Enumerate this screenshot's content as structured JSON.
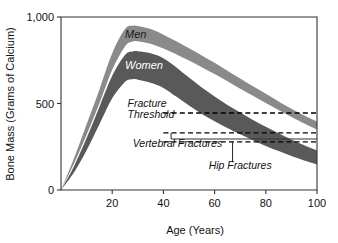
{
  "chart_data": {
    "type": "area",
    "title": "",
    "xlabel": "Age (Years)",
    "ylabel": "Bone Mass (Grams of Calcium)",
    "xlim": [
      0,
      100
    ],
    "ylim": [
      0,
      1000
    ],
    "grid": false,
    "legend_position": "inline-on-bands",
    "x_ticks": [
      20,
      40,
      60,
      80,
      100
    ],
    "x_tick_labels": [
      "20",
      "40",
      "60",
      "80",
      "100"
    ],
    "y_ticks": [
      0,
      500,
      1000
    ],
    "y_tick_labels": [
      "0",
      "500",
      "1,000"
    ],
    "series": [
      {
        "name": "Men",
        "label": "Men",
        "color": "#8a8a8a",
        "label_color": "#1a1a1a",
        "x": [
          0,
          5,
          10,
          15,
          20,
          25,
          28,
          30,
          35,
          40,
          45,
          50,
          55,
          60,
          65,
          70,
          75,
          80,
          85,
          90,
          95,
          100
        ],
        "upper": [
          0,
          180,
          380,
          580,
          790,
          930,
          950,
          948,
          930,
          898,
          860,
          820,
          778,
          735,
          690,
          645,
          600,
          556,
          512,
          470,
          430,
          395
        ],
        "lower": [
          0,
          150,
          320,
          500,
          695,
          830,
          858,
          860,
          845,
          818,
          785,
          748,
          710,
          670,
          628,
          585,
          545,
          503,
          462,
          422,
          385,
          350
        ]
      },
      {
        "name": "Women",
        "label": "Women",
        "color": "#595959",
        "label_color": "#ffffff",
        "x": [
          0,
          5,
          10,
          15,
          20,
          25,
          28,
          30,
          35,
          40,
          45,
          50,
          55,
          60,
          65,
          70,
          75,
          80,
          85,
          90,
          95,
          100
        ],
        "upper": [
          0,
          135,
          300,
          480,
          660,
          780,
          800,
          802,
          790,
          762,
          710,
          650,
          592,
          540,
          492,
          448,
          405,
          365,
          328,
          292,
          258,
          228
        ],
        "lower": [
          0,
          100,
          230,
          380,
          530,
          625,
          640,
          638,
          620,
          590,
          540,
          488,
          440,
          398,
          358,
          322,
          288,
          255,
          225,
          196,
          170,
          148
        ]
      }
    ],
    "threshold_lines": [
      {
        "name": "fracture-threshold",
        "value": 445,
        "x_start": 40,
        "x_end": 100,
        "style": "dashed"
      },
      {
        "name": "vertebral-fractures-threshold",
        "value": 330,
        "x_start": 40,
        "x_end": 100,
        "style": "dashed"
      },
      {
        "name": "hip-fractures-threshold",
        "value": 278,
        "x_start": 40,
        "x_end": 100,
        "style": "dashed"
      }
    ],
    "annotations": [
      {
        "name": "fracture-threshold",
        "lines": [
          "Fracture",
          "Threshold"
        ],
        "x": 26,
        "y": 480
      },
      {
        "name": "vertebral-fractures",
        "lines": [
          "Vertebral Fractures"
        ],
        "x": 28,
        "y": 250,
        "leader": {
          "type": "elbow",
          "x_tick": 43,
          "y_from": 330,
          "y_to": 295
        }
      },
      {
        "name": "hip-fractures",
        "lines": [
          "Hip Fractures"
        ],
        "x": 70,
        "y": 120,
        "leader": {
          "type": "vertical",
          "x": 67,
          "y_from": 278,
          "y_to": 160
        }
      },
      {
        "name": "men-band-label",
        "lines": [
          "Men"
        ],
        "x": 25,
        "y": 880
      },
      {
        "name": "women-band-label",
        "lines": [
          "Women"
        ],
        "x": 25,
        "y": 700
      }
    ]
  },
  "axes": {
    "y_title": "Bone Mass (Grams of Calcium)",
    "x_title": "Age (Years)",
    "y_tick_labels": [
      "1,000",
      "500",
      "0"
    ],
    "x_tick_labels": [
      "20",
      "40",
      "60",
      "80",
      "100"
    ]
  },
  "labels": {
    "men": "Men",
    "women": "Women",
    "fracture_line1": "Fracture",
    "fracture_line2": "Threshold",
    "vertebral": "Vertebral Fractures",
    "hip": "Hip Fractures"
  },
  "colors": {
    "men_band": "#8a8a8a",
    "women_band": "#595959",
    "axis": "#333333",
    "background": "#ffffff",
    "dashed": "#000000"
  }
}
